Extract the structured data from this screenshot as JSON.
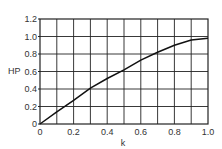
{
  "chart_data": {
    "type": "line",
    "title": "",
    "xlabel": "k",
    "ylabel": "HP",
    "xlim": [
      0,
      1.0
    ],
    "ylim": [
      0,
      1.2
    ],
    "xticks": [
      "0",
      "0.2",
      "0.4",
      "0.6",
      "0.8",
      "1.0"
    ],
    "yticks": [
      "0",
      "0.2",
      "0.4",
      "0.6",
      "0.8",
      "1.0",
      "1.2"
    ],
    "grid": true,
    "grid_x_step": 0.1,
    "grid_y_step": 0.2,
    "legend": null,
    "series": [
      {
        "name": "HP",
        "x": [
          0,
          0.1,
          0.2,
          0.3,
          0.4,
          0.5,
          0.6,
          0.7,
          0.8,
          0.9,
          1.0
        ],
        "values": [
          0,
          0.14,
          0.27,
          0.41,
          0.52,
          0.62,
          0.73,
          0.82,
          0.9,
          0.96,
          0.98
        ]
      }
    ]
  },
  "colors": {
    "line": "#111111",
    "grid": "#222222",
    "background": "#ffffff"
  }
}
